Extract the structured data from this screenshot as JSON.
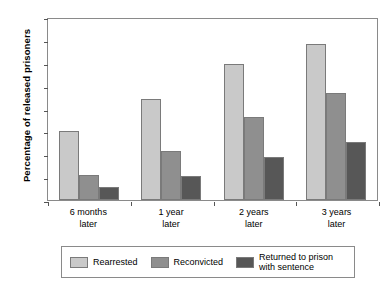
{
  "chart_data": {
    "type": "bar",
    "title": "",
    "xlabel": "",
    "ylabel": "Percentage of released prisoners",
    "ylim": [
      0,
      80
    ],
    "yticks": [
      0,
      10,
      20,
      30,
      40,
      50,
      60,
      70,
      80
    ],
    "grid": false,
    "legend_position": "bottom",
    "categories": [
      "6 months\nlater",
      "1 year\nlater",
      "2 years\nlater",
      "3 years\nlater"
    ],
    "categories_lines": [
      [
        "6 months",
        "later"
      ],
      [
        "1 year",
        "later"
      ],
      [
        "2 years",
        "later"
      ],
      [
        "3 years",
        "later"
      ]
    ],
    "series": [
      {
        "name": "Rearrested",
        "color": "#c9c9c9",
        "values": [
          30,
          44,
          59.5,
          68
        ]
      },
      {
        "name": "Reconvicted",
        "color": "#8f8f8f",
        "values": [
          11,
          21.5,
          36.5,
          47
        ]
      },
      {
        "name": "Returned to prison with sentence",
        "color": "#575757",
        "values": [
          5.5,
          10.5,
          19,
          25.5
        ]
      }
    ],
    "legend_labels": [
      "Rearrested",
      "Reconvicted",
      "Returned to prison with sentence"
    ]
  },
  "style": {
    "axis_color": "#8a8a8a",
    "bar_border": "#7a7a7a",
    "background": "#ffffff"
  }
}
